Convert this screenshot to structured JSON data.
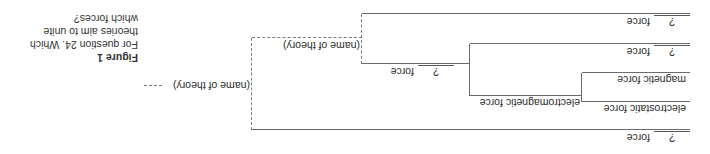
{
  "caption": {
    "figure_label": "Figure 1",
    "text_line1": "For question 24. Which",
    "text_line2": "theories aim to unite",
    "text_line3": "which forces?"
  },
  "tree": {
    "root_theory": "(name of theory)",
    "inner_theory": "(name of theory)",
    "branches": {
      "top_force_blank": "?",
      "top_force_label": "force",
      "mid_force_blank": "?",
      "mid_force_label": "force",
      "em_force_blank": "?",
      "em_force_label": "force",
      "bottom_force_blank": "?",
      "bottom_force_label": "force",
      "electromagnetic": "electromagnetic force",
      "magnetic": "magnetic force",
      "electrostatic": "electrostatic force"
    }
  },
  "colors": {
    "line": "#6a6a6a",
    "text": "#2b2b2b"
  }
}
